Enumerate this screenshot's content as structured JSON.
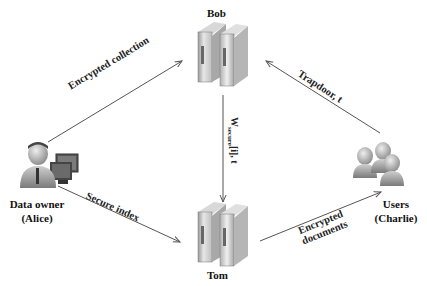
{
  "nodes": {
    "bob": {
      "label": "Bob",
      "icon": "server-icon"
    },
    "tom": {
      "label": "Tom",
      "icon": "server-icon"
    },
    "alice": {
      "label_line1": "Data owner",
      "label_line2": "(Alice)",
      "icon": "person-with-computer-icon"
    },
    "charlie": {
      "label_line1": "Users",
      "label_line2": "(Charlie)",
      "icon": "user-group-icon"
    }
  },
  "edges": {
    "alice_to_bob": {
      "label": "Encrypted collection"
    },
    "charlie_to_bob": {
      "label": "Trapdoor, t"
    },
    "bob_to_tom": {
      "label_main": "W",
      "label_sub": "secure",
      "label_rest": "[i], t"
    },
    "alice_to_tom": {
      "label": "Secure index"
    },
    "tom_to_charlie": {
      "label_line1": "Encrypted",
      "label_line2": "documents"
    }
  },
  "colors": {
    "line": "#555555",
    "server_light": "#e8e8e8",
    "server_dark": "#8a8a8a",
    "person": "#9a9a9a"
  }
}
